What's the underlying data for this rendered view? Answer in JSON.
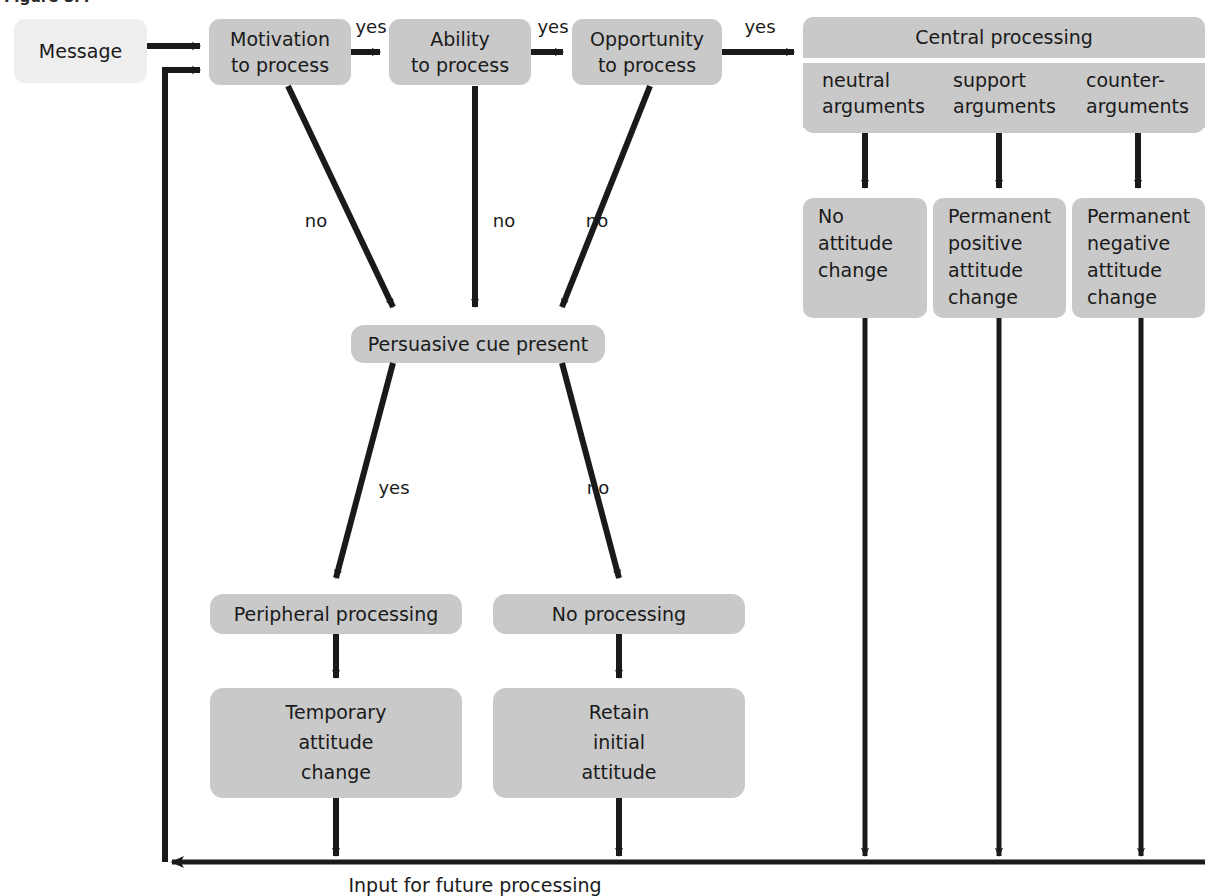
{
  "figure": {
    "top_partial_caption": "Figure 8.4",
    "bottom_caption": "Input for future processing",
    "colors": {
      "box_light": "#eeeeee",
      "box_gray": "#c9c9c9",
      "line": "#1a1a1a",
      "background": "#ffffff",
      "text": "#1a1a1a"
    }
  },
  "nodes": {
    "message": {
      "label": "Message"
    },
    "motivation": {
      "line1": "Motivation",
      "line2": "to process"
    },
    "ability": {
      "line1": "Ability",
      "line2": "to process"
    },
    "opportunity": {
      "line1": "Opportunity",
      "line2": "to process"
    },
    "central_processing": {
      "title": "Central processing"
    },
    "arguments": [
      {
        "line1": "neutral",
        "line2": "arguments"
      },
      {
        "line1": "support",
        "line2": "arguments"
      },
      {
        "line1": "counter-",
        "line2": "arguments"
      }
    ],
    "outcomes": [
      {
        "line1": "No",
        "line2": "attitude",
        "line3": "change",
        "line4": ""
      },
      {
        "line1": "Permanent",
        "line2": "positive",
        "line3": "attitude",
        "line4": "change"
      },
      {
        "line1": "Permanent",
        "line2": "negative",
        "line3": "attitude",
        "line4": "change"
      }
    ],
    "persuasive_cue": {
      "label": "Persuasive cue present"
    },
    "peripheral_processing": {
      "label": "Peripheral processing"
    },
    "no_processing": {
      "label": "No processing"
    },
    "temporary_change": {
      "line1": "Temporary",
      "line2": "attitude",
      "line3": "change"
    },
    "retain_attitude": {
      "line1": "Retain",
      "line2": "initial",
      "line3": "attitude"
    }
  },
  "edge_labels": {
    "motivation_yes": "yes",
    "ability_yes": "yes",
    "opportunity_yes": "yes",
    "motivation_no": "no",
    "ability_no": "no",
    "opportunity_no": "no",
    "cue_yes": "yes",
    "cue_no": "no"
  }
}
